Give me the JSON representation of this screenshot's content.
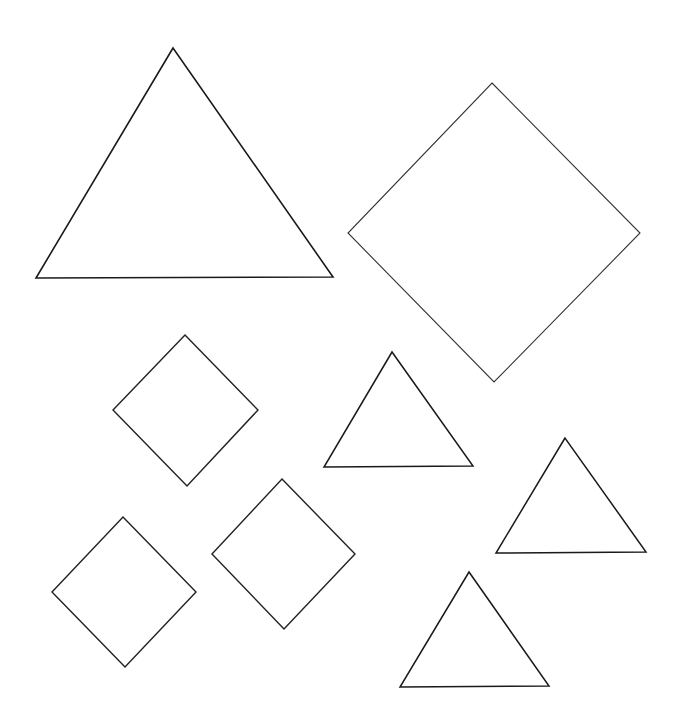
{
  "canvas": {
    "width": 684,
    "height": 725,
    "background": "#ffffff"
  },
  "shapes": [
    {
      "name": "large-triangle",
      "type": "triangle",
      "points": [
        [
          173,
          48
        ],
        [
          36,
          278
        ],
        [
          333,
          277
        ]
      ],
      "stroke": "#1a1a1a",
      "stroke_width": 1.6
    },
    {
      "name": "large-diamond",
      "type": "diamond",
      "points": [
        [
          492,
          83
        ],
        [
          640,
          233
        ],
        [
          494,
          382
        ],
        [
          348,
          233
        ]
      ],
      "stroke": "#333333",
      "stroke_width": 1.1
    },
    {
      "name": "small-diamond-upper-left",
      "type": "diamond",
      "points": [
        [
          185,
          335
        ],
        [
          258,
          410
        ],
        [
          187,
          486
        ],
        [
          113,
          410
        ]
      ],
      "stroke": "#222222",
      "stroke_width": 1.4
    },
    {
      "name": "small-triangle-center",
      "type": "triangle",
      "points": [
        [
          392,
          352
        ],
        [
          324,
          467
        ],
        [
          473,
          466
        ]
      ],
      "stroke": "#1a1a1a",
      "stroke_width": 1.5
    },
    {
      "name": "small-triangle-right",
      "type": "triangle",
      "points": [
        [
          565,
          438
        ],
        [
          496,
          553
        ],
        [
          646,
          552
        ]
      ],
      "stroke": "#1a1a1a",
      "stroke_width": 1.5
    },
    {
      "name": "small-diamond-center",
      "type": "diamond",
      "points": [
        [
          282,
          479
        ],
        [
          355,
          554
        ],
        [
          284,
          629
        ],
        [
          212,
          554
        ]
      ],
      "stroke": "#222222",
      "stroke_width": 1.4
    },
    {
      "name": "small-diamond-lower-left",
      "type": "diamond",
      "points": [
        [
          123,
          517
        ],
        [
          196,
          592
        ],
        [
          125,
          667
        ],
        [
          52,
          592
        ]
      ],
      "stroke": "#222222",
      "stroke_width": 1.4
    },
    {
      "name": "small-triangle-bottom",
      "type": "triangle",
      "points": [
        [
          469,
          572
        ],
        [
          400,
          687
        ],
        [
          549,
          686
        ]
      ],
      "stroke": "#1a1a1a",
      "stroke_width": 1.5
    }
  ]
}
